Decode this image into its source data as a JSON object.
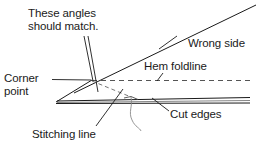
{
  "figure": {
    "background_color": "#ffffff",
    "line_color": "#1a1a1a",
    "text_color": "#1a1a1a"
  },
  "labels": {
    "these_angles": "These angles\nshould match.",
    "wrong_side": "Wrong side",
    "hem_foldline": "Hem foldline",
    "corner_point": "Corner\npoint",
    "cut_edges": "Cut edges",
    "stitching_line": "Stitching line"
  },
  "geometry": {
    "corner_point": {
      "x": 92,
      "y": 80
    },
    "apex_point": {
      "x": 56,
      "y": 102
    },
    "foldline": {
      "type": "dashed-horizontal",
      "x1": 92,
      "x2": 250,
      "y": 80
    },
    "wrong_side_diagonal": {
      "x1": 74,
      "y1": 93,
      "x2": 256,
      "y2": 5
    },
    "miter_diagonal_dashed": {
      "x1": 92,
      "y1": 81,
      "x2": 131,
      "y2": 97
    },
    "cut_edge_band": {
      "x1": 56,
      "x2": 250,
      "y_top": 97,
      "y_bottom": 103
    },
    "thread_tail": {
      "start": {
        "x": 131,
        "y": 97
      },
      "end": {
        "x": 141,
        "y": 131
      }
    }
  },
  "leaders": {
    "these_angles_a": {
      "x1": 84,
      "y1": 36,
      "x2": 93,
      "y2": 81
    },
    "these_angles_b": {
      "x1": 87,
      "y1": 36,
      "x2": 97,
      "y2": 92
    },
    "corner_point": {
      "x1": 52,
      "y1": 79,
      "x2": 91,
      "y2": 80
    },
    "hem_foldline": {
      "x1": 163,
      "y1": 74,
      "x2": 158,
      "y2": 81
    },
    "wrong_side_tick": {
      "x1": 160,
      "y1": 48,
      "x2": 176,
      "y2": 36
    },
    "cut_edges": {
      "x1": 168,
      "y1": 110,
      "x2": 152,
      "y2": 98
    },
    "stitching_line": {
      "x1": 96,
      "y1": 126,
      "x2": 122,
      "y2": 90
    }
  }
}
